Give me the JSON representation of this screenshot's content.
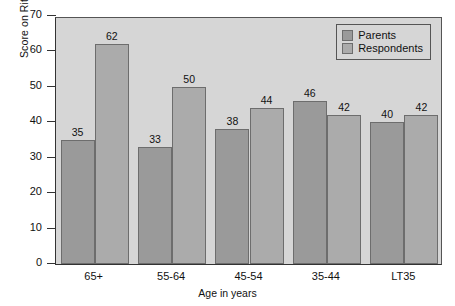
{
  "chart_data": {
    "type": "bar",
    "title": "",
    "xlabel": "Age in years",
    "ylabel": "Score on Ritual Observance Index",
    "categories": [
      "65+",
      "55-64",
      "45-54",
      "35-44",
      "LT35"
    ],
    "series": [
      {
        "name": "Parents",
        "values": [
          35,
          33,
          38,
          46,
          40
        ],
        "color": "#9a9a9a"
      },
      {
        "name": "Respondents",
        "values": [
          62,
          50,
          44,
          42,
          42
        ],
        "color": "#ababab"
      }
    ],
    "ylim": [
      0,
      70
    ],
    "yticks": [
      0,
      10,
      20,
      30,
      40,
      50,
      60,
      70
    ],
    "ytick_labels": [
      "0",
      "10",
      "20",
      "30",
      "40",
      "50",
      "60",
      "70"
    ],
    "grid": false,
    "legend_position": "top-right",
    "plot_background": "#d6d6d6",
    "figure_background": "#ffffff",
    "axis_color": "#333333",
    "data_labels": true
  },
  "legend": {
    "items": [
      {
        "label": "Parents"
      },
      {
        "label": "Respondents"
      }
    ]
  }
}
